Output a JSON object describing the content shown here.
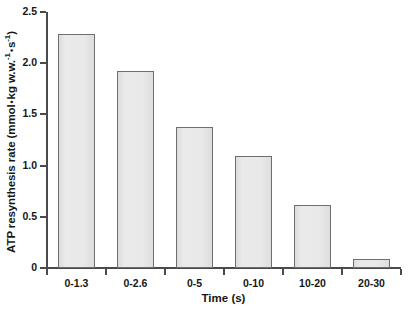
{
  "chart_data": {
    "type": "bar",
    "title": "",
    "xlabel": "Time (s)",
    "ylabel": "ATP resynthesis rate (mmol • kg w.w.⁻¹ • s⁻¹)",
    "ylabel_parts": {
      "lead": "ATP resynthesis rate (mmol",
      "sep1": "•",
      "mid": "kg w.w.",
      "sup1": "-1",
      "sep2": "•",
      "tail": "s",
      "sup2": "-1",
      "close": ")"
    },
    "categories": [
      "0-1.3",
      "0-2.6",
      "0-5",
      "0-10",
      "10-20",
      "20-30"
    ],
    "values": [
      2.29,
      1.92,
      1.38,
      1.09,
      0.62,
      0.09
    ],
    "ylim": [
      0,
      2.5
    ],
    "ytick_labels": [
      "0",
      "0.5",
      "1.0",
      "1.5",
      "2.0",
      "2.5"
    ],
    "ytick_values": [
      0,
      0.5,
      1.0,
      1.5,
      2.0,
      2.5
    ],
    "grid": false,
    "legend": null,
    "bar_fill_color": "#e6e6e6",
    "bar_border_color": "#6e6e6e",
    "axis_color": "#4a4a4a",
    "background_color": "#ffffff"
  }
}
